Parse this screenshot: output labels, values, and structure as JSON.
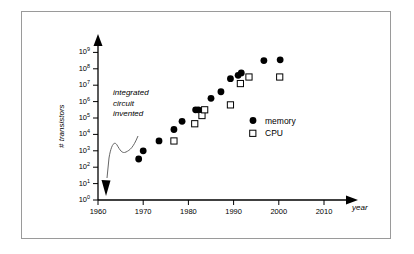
{
  "chart_data": {
    "type": "scatter",
    "title": "",
    "xlabel": "year",
    "ylabel": "# transistors",
    "xlim": [
      1958,
      2014
    ],
    "ylim": [
      0,
      9
    ],
    "y_scale": "log10",
    "grid": false,
    "legend_position": "right-middle",
    "xticks": [
      "1960",
      "1970",
      "1980",
      "1990",
      "2000",
      "2010"
    ],
    "xtick_values": [
      1960,
      1970,
      1980,
      1990,
      2000,
      2010
    ],
    "ytick_exponents": [
      0,
      1,
      2,
      3,
      4,
      5,
      6,
      7,
      8,
      9
    ],
    "yticks": [
      {
        "mantissa": "10",
        "exp": "0"
      },
      {
        "mantissa": "10",
        "exp": "1"
      },
      {
        "mantissa": "10",
        "exp": "2"
      },
      {
        "mantissa": "10",
        "exp": "3"
      },
      {
        "mantissa": "10",
        "exp": "4"
      },
      {
        "mantissa": "10",
        "exp": "5"
      },
      {
        "mantissa": "10",
        "exp": "6"
      },
      {
        "mantissa": "10",
        "exp": "7"
      },
      {
        "mantissa": "10",
        "exp": "8"
      },
      {
        "mantissa": "10",
        "exp": "9"
      }
    ],
    "annotations": [
      {
        "name": "integrated-circuit-invented",
        "lines": [
          "integrated",
          "circuit",
          "invented"
        ],
        "points_to_year": 1962
      }
    ],
    "series": [
      {
        "name": "memory",
        "marker": "filled-circle",
        "color": "#000000",
        "points": [
          {
            "x": 1969,
            "y": 2.5
          },
          {
            "x": 1970,
            "y": 3.0
          },
          {
            "x": 1973.5,
            "y": 3.6
          },
          {
            "x": 1976.8,
            "y": 4.3
          },
          {
            "x": 1978.6,
            "y": 4.8
          },
          {
            "x": 1981.6,
            "y": 5.5
          },
          {
            "x": 1982.2,
            "y": 5.5
          },
          {
            "x": 1985.0,
            "y": 6.2
          },
          {
            "x": 1987.2,
            "y": 6.6
          },
          {
            "x": 1989.3,
            "y": 7.4
          },
          {
            "x": 1991.0,
            "y": 7.6
          },
          {
            "x": 1991.7,
            "y": 7.75
          },
          {
            "x": 1996.7,
            "y": 8.5
          },
          {
            "x": 2000.3,
            "y": 8.55
          }
        ]
      },
      {
        "name": "CPU",
        "marker": "open-square",
        "color": "#000000",
        "points": [
          {
            "x": 1976.8,
            "y": 3.6
          },
          {
            "x": 1981.4,
            "y": 4.65
          },
          {
            "x": 1983.0,
            "y": 5.15
          },
          {
            "x": 1983.6,
            "y": 5.5
          },
          {
            "x": 1989.3,
            "y": 5.8
          },
          {
            "x": 1991.5,
            "y": 7.1
          },
          {
            "x": 1993.4,
            "y": 7.5
          },
          {
            "x": 2000.2,
            "y": 7.5
          }
        ]
      }
    ],
    "legend": [
      {
        "label": "memory",
        "marker": "filled-circle"
      },
      {
        "label": "CPU",
        "marker": "open-square"
      }
    ]
  }
}
